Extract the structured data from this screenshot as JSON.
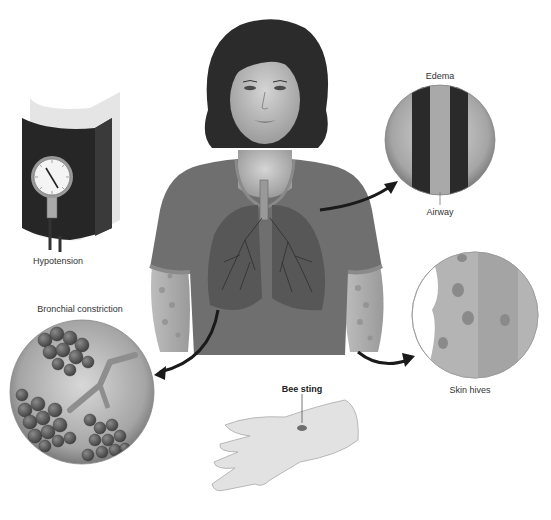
{
  "figure": {
    "labels": {
      "hypotension": "Hypotension",
      "bronchial": "Bronchial constriction",
      "edema": "Edema",
      "airway": "Airway",
      "skin_hives": "Skin hives",
      "bee_sting": "Bee sting"
    },
    "gauge_ticks": [
      "20",
      "40",
      "60",
      "80",
      "100",
      "120",
      "140",
      "160",
      "180",
      "200",
      "220",
      "240",
      "260",
      "280",
      "300"
    ],
    "colors": {
      "shirt": "#6f6f6f",
      "skin": "#c9c9c9",
      "hair": "#2b2b2b",
      "cuff": "#262626",
      "arrow": "#1a1a1a",
      "lung": "#5a5a5a"
    }
  }
}
